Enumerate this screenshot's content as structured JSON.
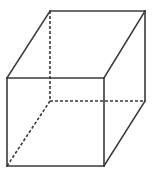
{
  "figure": {
    "name": "cube-wireframe",
    "canvas": {
      "width": 152,
      "height": 175,
      "background": "#ffffff"
    },
    "stroke": {
      "visible_color": "#3a3a3a",
      "hidden_color": "#3a3a3a",
      "visible_width": 1.6,
      "hidden_width": 1.6,
      "hidden_dash": "3 2"
    },
    "vertices": {
      "front_top_left": {
        "x": 7,
        "y": 78
      },
      "front_top_right": {
        "x": 104,
        "y": 78
      },
      "front_bottom_right": {
        "x": 104,
        "y": 166
      },
      "front_bottom_left": {
        "x": 7,
        "y": 166
      },
      "back_top_left": {
        "x": 50,
        "y": 11
      },
      "back_top_right": {
        "x": 145,
        "y": 11
      },
      "back_bottom_right": {
        "x": 145,
        "y": 101
      },
      "back_bottom_left": {
        "x": 50,
        "y": 101
      }
    },
    "edges": {
      "visible": [
        {
          "name": "front-top-edge",
          "from": "front_top_left",
          "to": "front_top_right"
        },
        {
          "name": "front-right-edge",
          "from": "front_top_right",
          "to": "front_bottom_right"
        },
        {
          "name": "front-bottom-edge",
          "from": "front_bottom_right",
          "to": "front_bottom_left"
        },
        {
          "name": "front-left-edge",
          "from": "front_bottom_left",
          "to": "front_top_left"
        },
        {
          "name": "back-top-edge",
          "from": "back_top_left",
          "to": "back_top_right"
        },
        {
          "name": "back-right-edge",
          "from": "back_top_right",
          "to": "back_bottom_right"
        },
        {
          "name": "top-left-connector",
          "from": "front_top_left",
          "to": "back_top_left"
        },
        {
          "name": "top-right-connector",
          "from": "front_top_right",
          "to": "back_top_right"
        },
        {
          "name": "bottom-right-connector",
          "from": "front_bottom_right",
          "to": "back_bottom_right"
        }
      ],
      "hidden": [
        {
          "name": "back-left-edge",
          "from": "back_top_left",
          "to": "back_bottom_left"
        },
        {
          "name": "back-bottom-edge",
          "from": "back_bottom_left",
          "to": "back_bottom_right"
        },
        {
          "name": "bottom-left-connector",
          "from": "back_bottom_left",
          "to": "front_bottom_left"
        }
      ]
    }
  }
}
